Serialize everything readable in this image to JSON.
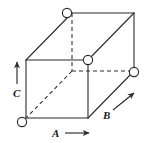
{
  "figure": {
    "canvas": {
      "width": 146,
      "height": 143,
      "background": "#ffffff"
    },
    "style": {
      "line_color": "#2b2b2b",
      "line_width": 1.1,
      "hidden_line_dash": "4,3",
      "marker_stroke": "#2b2b2b",
      "marker_fill": "#ffffff",
      "marker_radius": 4.6,
      "label_color": "#1a1a1a"
    },
    "vertices": {
      "front_top_left": {
        "x": 26,
        "y": 60
      },
      "front_top_right": {
        "x": 88,
        "y": 60
      },
      "front_bottom_right": {
        "x": 88,
        "y": 118
      },
      "front_bottom_left": {
        "x": 26,
        "y": 118
      },
      "back_top_left": {
        "x": 72,
        "y": 13
      },
      "back_top_right": {
        "x": 134,
        "y": 13
      },
      "back_bottom_right": {
        "x": 134,
        "y": 71
      },
      "back_bottom_left": {
        "x": 72,
        "y": 71
      }
    },
    "visible_edges": [
      {
        "name": "front-top",
        "x1": 26,
        "y1": 60,
        "x2": 88,
        "y2": 60
      },
      {
        "name": "front-right",
        "x1": 88,
        "y1": 60,
        "x2": 88,
        "y2": 118
      },
      {
        "name": "front-bottom",
        "x1": 88,
        "y1": 118,
        "x2": 26,
        "y2": 118
      },
      {
        "name": "front-left",
        "x1": 26,
        "y1": 118,
        "x2": 26,
        "y2": 60
      },
      {
        "name": "back-top",
        "x1": 72,
        "y1": 13,
        "x2": 134,
        "y2": 13
      },
      {
        "name": "back-right",
        "x1": 134,
        "y1": 13,
        "x2": 134,
        "y2": 71
      },
      {
        "name": "top-left-diagonal",
        "x1": 26,
        "y1": 60,
        "x2": 72,
        "y2": 13
      },
      {
        "name": "top-right-diagonal",
        "x1": 88,
        "y1": 60,
        "x2": 134,
        "y2": 13
      },
      {
        "name": "bottom-right-diagonal",
        "x1": 88,
        "y1": 118,
        "x2": 134,
        "y2": 71
      }
    ],
    "hidden_edges": [
      {
        "name": "hidden-vertical-back-left",
        "x1": 72,
        "y1": 13,
        "x2": 72,
        "y2": 71
      },
      {
        "name": "hidden-back-bottom",
        "x1": 72,
        "y1": 71,
        "x2": 134,
        "y2": 71
      },
      {
        "name": "hidden-bottom-left-diagonal",
        "x1": 72,
        "y1": 71,
        "x2": 26,
        "y2": 118
      }
    ],
    "markers": [
      {
        "name": "lattice-site-top-back-left",
        "x": 67,
        "y": 13
      },
      {
        "name": "lattice-site-front-top-right",
        "x": 88,
        "y": 60
      },
      {
        "name": "lattice-site-back-bottom-right",
        "x": 134,
        "y": 72
      },
      {
        "name": "lattice-site-front-bottom-left",
        "x": 22,
        "y": 122
      }
    ],
    "axes": [
      {
        "id": "c",
        "label": "C",
        "direction": "up",
        "arrow": {
          "x1": 17,
          "y1": 84,
          "x2": 17,
          "y2": 62
        },
        "label_pos": {
          "x": 13,
          "y": 97
        }
      },
      {
        "id": "a",
        "label": "A",
        "direction": "right",
        "arrow": {
          "x1": 65,
          "y1": 133,
          "x2": 89,
          "y2": 133
        },
        "label_pos": {
          "x": 52,
          "y": 137
        }
      },
      {
        "id": "b",
        "label": "B",
        "direction": "up-right",
        "arrow": {
          "x1": 113,
          "y1": 110,
          "x2": 134,
          "y2": 93
        },
        "label_pos": {
          "x": 103,
          "y": 119
        }
      }
    ]
  }
}
